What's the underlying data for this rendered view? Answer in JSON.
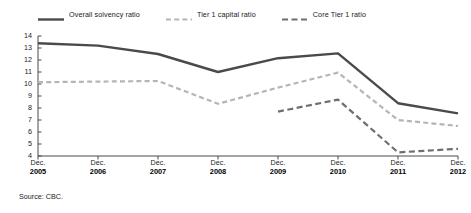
{
  "chart_data": {
    "type": "line",
    "title": "",
    "subtitle": "",
    "xlabel": "",
    "ylabel": "",
    "categories": [
      "Dec. 2005",
      "Dec. 2006",
      "Dec. 2007",
      "Dec. 2008",
      "Dec. 2009",
      "Dec. 2010",
      "Dec. 2011",
      "Dec. 2012"
    ],
    "x_tick_months": [
      "Dec.",
      "Dec.",
      "Dec.",
      "Dec.",
      "Dec.",
      "Dec.",
      "Dec.",
      "Dec."
    ],
    "x_tick_years": [
      "2005",
      "2006",
      "2007",
      "2008",
      "2009",
      "2010",
      "2011",
      "2012"
    ],
    "ylim": [
      4,
      14
    ],
    "y_ticks": [
      14,
      13,
      12,
      11,
      10,
      9,
      8,
      7,
      6,
      5,
      4
    ],
    "y_tick_labels": [
      "14",
      "13",
      "12",
      "11",
      "10",
      "9",
      "8",
      "7",
      "6",
      "5",
      "4"
    ],
    "grid": false,
    "legend_position": "top-left",
    "series": [
      {
        "name": "Overall solvency ratio",
        "color": "#4a4a4a",
        "style": "solid",
        "width": 2.4,
        "values": [
          13.4,
          13.2,
          12.5,
          11.0,
          12.15,
          12.55,
          8.4,
          7.55
        ]
      },
      {
        "name": "Tier 1 capital ratio",
        "color": "#b5b5b5",
        "style": "dashed",
        "width": 2.2,
        "values": [
          10.15,
          10.2,
          10.25,
          8.35,
          9.7,
          10.95,
          7.0,
          6.5
        ]
      },
      {
        "name": "Core Tier 1 ratio",
        "color": "#6e6e6e",
        "style": "dashed",
        "width": 2.2,
        "values": [
          null,
          null,
          null,
          null,
          7.7,
          8.7,
          4.3,
          4.6
        ]
      }
    ]
  },
  "source": {
    "text": "Source: CBC."
  },
  "axis": {
    "line_color": "#4a4a4a"
  }
}
